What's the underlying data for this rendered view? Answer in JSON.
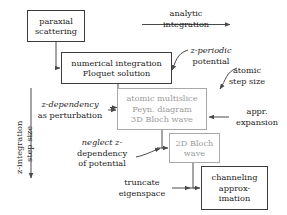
{
  "diagram": {
    "colors": {
      "box_border": "#3c3c3c",
      "box_border_gray": "#a8a8a8",
      "text": "#1c1c1c",
      "text_gray": "#9a9a9a",
      "wire": "#4a4a4a",
      "background": "#ffffff"
    },
    "boxes": [
      {
        "id": "paraxial-scattering",
        "lines": [
          "paraxial",
          "scattering"
        ],
        "style": "solid"
      },
      {
        "id": "numerical-integration",
        "lines": [
          "numerical integration",
          "Floquet solution"
        ],
        "style": "solid"
      },
      {
        "id": "atomic-multislice",
        "lines": [
          "atomic multislice",
          "Feyn. diagram",
          "3D Bloch wave"
        ],
        "style": "gray"
      },
      {
        "id": "2d-bloch-wave",
        "lines": [
          "2D Bloch",
          "wave"
        ],
        "style": "gray"
      },
      {
        "id": "channeling-approximation",
        "lines": [
          "channeling",
          "approx-",
          "imation"
        ],
        "style": "solid"
      }
    ],
    "edge_labels": [
      {
        "id": "analytic-integration",
        "lines": [
          "analytic",
          "integration"
        ]
      },
      {
        "id": "z-periodic-potential",
        "lines": [
          "z-periodic",
          "potential"
        ],
        "italic_first_char": "z"
      },
      {
        "id": "atomic-step-size",
        "lines": [
          "atomic",
          "step size"
        ]
      },
      {
        "id": "z-dependency-as-perturbation",
        "lines": [
          "z-dependency",
          "as perturbation"
        ]
      },
      {
        "id": "appr-expansion",
        "lines": [
          "appr.",
          "expansion"
        ]
      },
      {
        "id": "neglect-z-dependency-of-potential",
        "lines": [
          "neglect z-",
          "dependency",
          "of potential"
        ]
      },
      {
        "id": "truncate-eigenspace",
        "lines": [
          "truncate",
          "eigenspace"
        ]
      }
    ],
    "axis": {
      "id": "z-integration-step-size",
      "line1": "z-integration",
      "line2": "step size",
      "direction": "downward"
    }
  }
}
